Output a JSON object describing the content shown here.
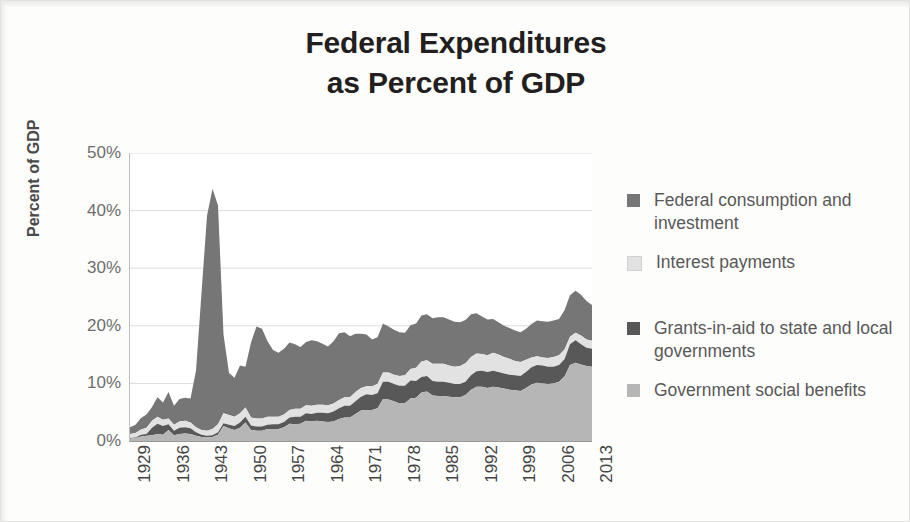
{
  "title": {
    "line1": "Federal Expenditures",
    "line2": "as Percent of GDP"
  },
  "axes": {
    "y_title": "Percent of GDP",
    "y_ticks": [
      "50%",
      "40%",
      "30%",
      "20%",
      "10%",
      "0%"
    ],
    "x_ticks": [
      "1929",
      "1936",
      "1943",
      "1950",
      "1957",
      "1964",
      "1971",
      "1978",
      "1985",
      "1992",
      "1999",
      "2006",
      "2013"
    ]
  },
  "legend": {
    "items": [
      {
        "label": "Federal consumption and investment",
        "color": "#767676",
        "swatch_name": "legend-swatch-federal-consumption"
      },
      {
        "label": "Interest payments",
        "color": "#e2e2e2",
        "swatch_name": "legend-swatch-interest-payments"
      },
      {
        "label": "Grants-in-aid to state and local governments",
        "color": "#585858",
        "swatch_name": "legend-swatch-grants-in-aid"
      },
      {
        "label": "Government social benefits",
        "color": "#b6b6b6",
        "swatch_name": "legend-swatch-social-benefits"
      }
    ]
  },
  "chart_data": {
    "type": "area",
    "stacked": true,
    "title": "Federal Expenditures as Percent of GDP",
    "xlabel": "",
    "ylabel": "Percent of GDP",
    "ylim": [
      0,
      50
    ],
    "xlim": [
      1929,
      2013
    ],
    "grid": "horizontal",
    "legend_position": "right",
    "x": [
      1929,
      1930,
      1931,
      1932,
      1933,
      1934,
      1935,
      1936,
      1937,
      1938,
      1939,
      1940,
      1941,
      1942,
      1943,
      1944,
      1945,
      1946,
      1947,
      1948,
      1949,
      1950,
      1951,
      1952,
      1953,
      1954,
      1955,
      1956,
      1957,
      1958,
      1959,
      1960,
      1961,
      1962,
      1963,
      1964,
      1965,
      1966,
      1967,
      1968,
      1969,
      1970,
      1971,
      1972,
      1973,
      1974,
      1975,
      1976,
      1977,
      1978,
      1979,
      1980,
      1981,
      1982,
      1983,
      1984,
      1985,
      1986,
      1987,
      1988,
      1989,
      1990,
      1991,
      1992,
      1993,
      1994,
      1995,
      1996,
      1997,
      1998,
      1999,
      2000,
      2001,
      2002,
      2003,
      2004,
      2005,
      2006,
      2007,
      2008,
      2009,
      2010,
      2011,
      2012,
      2013
    ],
    "series": [
      {
        "name": "Government social benefits",
        "color": "#b6b6b6",
        "stack_order": 1,
        "values": [
          0.4,
          0.5,
          0.8,
          0.9,
          1.0,
          1.2,
          1.1,
          1.9,
          1.0,
          1.2,
          1.3,
          1.2,
          0.9,
          0.7,
          0.6,
          0.7,
          1.1,
          2.6,
          2.2,
          1.9,
          2.3,
          3.2,
          1.9,
          1.8,
          1.8,
          2.1,
          2.1,
          2.1,
          2.4,
          3.0,
          2.9,
          3.0,
          3.5,
          3.4,
          3.5,
          3.4,
          3.3,
          3.4,
          3.8,
          4.1,
          4.1,
          4.7,
          5.3,
          5.4,
          5.4,
          5.7,
          7.3,
          7.2,
          6.9,
          6.5,
          6.6,
          7.4,
          7.5,
          8.4,
          8.6,
          7.9,
          7.8,
          7.8,
          7.7,
          7.6,
          7.6,
          8.0,
          8.9,
          9.4,
          9.4,
          9.2,
          9.4,
          9.3,
          9.1,
          8.9,
          8.8,
          8.7,
          9.2,
          9.8,
          10.1,
          10.0,
          9.9,
          10.0,
          10.3,
          11.2,
          13.2,
          13.6,
          13.3,
          13.0,
          12.9
        ]
      },
      {
        "name": "Grants-in-aid to state and local governments",
        "color": "#585858",
        "stack_order": 2,
        "values": [
          0.1,
          0.1,
          0.3,
          0.3,
          1.3,
          1.8,
          1.5,
          1.0,
          0.8,
          1.1,
          1.1,
          1.0,
          0.6,
          0.4,
          0.3,
          0.3,
          0.4,
          0.5,
          0.6,
          0.7,
          0.9,
          1.0,
          0.8,
          0.7,
          0.7,
          0.7,
          0.8,
          0.8,
          0.9,
          1.1,
          1.3,
          1.2,
          1.3,
          1.3,
          1.4,
          1.5,
          1.5,
          1.7,
          1.9,
          2.0,
          2.0,
          2.2,
          2.4,
          2.7,
          2.6,
          2.6,
          3.0,
          3.1,
          3.0,
          3.1,
          3.0,
          3.1,
          2.9,
          2.7,
          2.7,
          2.5,
          2.5,
          2.5,
          2.4,
          2.3,
          2.3,
          2.3,
          2.5,
          2.7,
          2.8,
          2.8,
          2.8,
          2.7,
          2.6,
          2.6,
          2.6,
          2.6,
          2.8,
          3.0,
          3.1,
          3.1,
          3.0,
          2.9,
          2.9,
          3.0,
          3.6,
          3.9,
          3.5,
          3.2,
          3.1
        ]
      },
      {
        "name": "Interest payments",
        "color": "#e2e2e2",
        "stack_order": 3,
        "values": [
          0.7,
          0.8,
          0.9,
          1.1,
          1.2,
          1.2,
          1.1,
          1.0,
          1.0,
          1.1,
          1.1,
          1.0,
          0.9,
          0.8,
          0.9,
          1.1,
          1.4,
          1.7,
          1.7,
          1.6,
          1.6,
          1.6,
          1.4,
          1.4,
          1.4,
          1.4,
          1.3,
          1.3,
          1.3,
          1.3,
          1.4,
          1.4,
          1.4,
          1.4,
          1.4,
          1.4,
          1.4,
          1.4,
          1.4,
          1.5,
          1.5,
          1.6,
          1.5,
          1.4,
          1.5,
          1.6,
          1.6,
          1.6,
          1.6,
          1.7,
          1.8,
          2.0,
          2.3,
          2.7,
          2.7,
          3.0,
          3.1,
          3.1,
          3.0,
          3.0,
          3.1,
          3.2,
          3.2,
          3.1,
          2.9,
          2.9,
          3.1,
          3.0,
          2.9,
          2.8,
          2.5,
          2.4,
          2.1,
          1.7,
          1.5,
          1.4,
          1.5,
          1.7,
          1.7,
          1.7,
          1.3,
          1.3,
          1.5,
          1.4,
          1.4
        ]
      },
      {
        "name": "Federal consumption and investment",
        "color": "#767676",
        "stack_order": 4,
        "values": [
          1.2,
          1.4,
          2.0,
          2.3,
          2.4,
          3.4,
          3.0,
          4.6,
          3.3,
          3.9,
          4.0,
          4.2,
          9.8,
          23.8,
          37.3,
          41.7,
          38.0,
          13.7,
          7.3,
          6.8,
          8.3,
          7.1,
          13.0,
          16.0,
          15.6,
          13.1,
          11.6,
          11.1,
          11.4,
          11.7,
          11.2,
          10.7,
          11.0,
          11.4,
          11.0,
          10.6,
          10.2,
          10.8,
          11.6,
          11.3,
          10.6,
          10.1,
          9.4,
          9.0,
          8.1,
          8.1,
          8.5,
          8.0,
          7.8,
          7.6,
          7.4,
          7.6,
          7.7,
          8.0,
          8.0,
          7.9,
          8.1,
          8.1,
          8.0,
          7.8,
          7.6,
          7.5,
          7.4,
          7.0,
          6.5,
          6.2,
          5.9,
          5.6,
          5.4,
          5.3,
          5.3,
          5.2,
          5.4,
          5.8,
          6.2,
          6.3,
          6.3,
          6.3,
          6.3,
          6.8,
          7.2,
          7.3,
          7.1,
          6.7,
          6.2
        ]
      }
    ],
    "annotations": [
      {
        "text": "WWII peak",
        "x": 1944,
        "total": 46.5
      },
      {
        "text": "post-2008 peak",
        "x": 2009,
        "total": 25.3
      }
    ]
  }
}
